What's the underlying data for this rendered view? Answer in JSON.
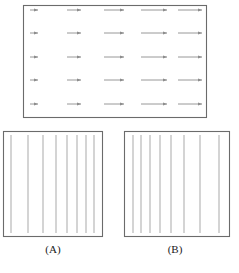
{
  "figure": {
    "background": "#ffffff",
    "stroke_color": "#8c8c8c",
    "border_color": "#6b6b6b",
    "text_color": "#1a1a1a"
  },
  "panels": [
    {
      "id": "top-vector-field",
      "role": "vector-field",
      "label": "",
      "box": {
        "x": 23,
        "y": 5,
        "width": 184,
        "height": 113
      },
      "field": {
        "type": "arrow-grid",
        "columns": 5,
        "rows": 5,
        "direction": "right",
        "column_x": [
          30,
          67,
          104,
          141,
          178
        ],
        "row_y": [
          10,
          33,
          57,
          80,
          104
        ],
        "arrow_lengths": [
          8,
          14,
          20,
          26,
          32
        ],
        "description": "Uniform horizontal flow whose speed increases from left to right"
      }
    },
    {
      "id": "panel-a",
      "role": "streamlines",
      "label": "(A)",
      "box": {
        "x": 3,
        "y": 131,
        "width": 100,
        "height": 106
      },
      "field": {
        "type": "vertical-lines",
        "count": 8,
        "positions": [
          8,
          25,
          40,
          53,
          64,
          74,
          83,
          91
        ],
        "spacing": "decreasing-left-to-right",
        "description": "Streamlines widely spaced at left, converging toward the right"
      }
    },
    {
      "id": "panel-b",
      "role": "streamlines",
      "label": "(B)",
      "box": {
        "x": 124,
        "y": 131,
        "width": 106,
        "height": 106
      },
      "field": {
        "type": "vertical-lines",
        "count": 8,
        "positions": [
          9,
          17,
          26,
          36,
          47,
          60,
          76,
          95
        ],
        "spacing": "increasing-left-to-right",
        "description": "Streamlines closely spaced at left, diverging toward the right"
      }
    }
  ],
  "labels": {
    "panel_a": "(A)",
    "panel_b": "(B)"
  }
}
